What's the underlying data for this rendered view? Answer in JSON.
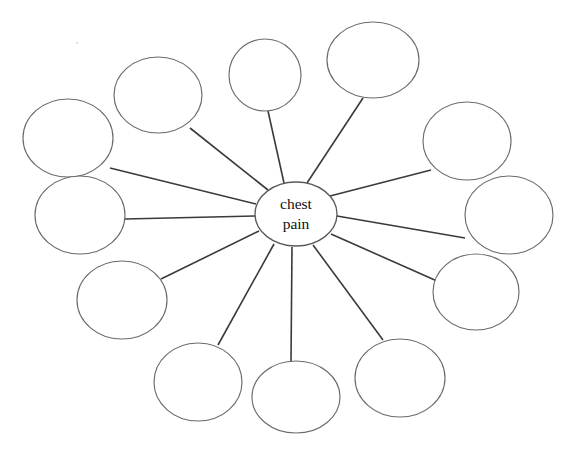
{
  "diagram": {
    "type": "spider-concept-map",
    "title_text": "chest pain",
    "center": {
      "label_line1": "chest",
      "label_line2": "pain",
      "cx": 296,
      "cy": 214,
      "rx": 41,
      "ry": 32
    },
    "stroke_color": "#6b6b6b",
    "spoke_color": "#3a3a3a",
    "background_color": "#ffffff",
    "satellite_count": 12,
    "satellites": [
      {
        "id": "node-1",
        "label": "",
        "position": "upper-left-outer",
        "cx": 68,
        "cy": 138,
        "rx": 45,
        "ry": 39
      },
      {
        "id": "node-2",
        "label": "",
        "position": "upper-left",
        "cx": 158,
        "cy": 95,
        "rx": 44,
        "ry": 38
      },
      {
        "id": "node-3",
        "label": "",
        "position": "top-center",
        "cx": 265,
        "cy": 75,
        "rx": 36,
        "ry": 36
      },
      {
        "id": "node-4",
        "label": "",
        "position": "top-right",
        "cx": 373,
        "cy": 60,
        "rx": 46,
        "ry": 38
      },
      {
        "id": "node-5",
        "label": "",
        "position": "right-upper",
        "cx": 467,
        "cy": 141,
        "rx": 44,
        "ry": 39
      },
      {
        "id": "node-6",
        "label": "",
        "position": "right-middle",
        "cx": 509,
        "cy": 215,
        "rx": 44,
        "ry": 39
      },
      {
        "id": "node-7",
        "label": "",
        "position": "right-lower",
        "cx": 476,
        "cy": 292,
        "rx": 43,
        "ry": 38
      },
      {
        "id": "node-8",
        "label": "",
        "position": "bottom-right",
        "cx": 400,
        "cy": 378,
        "rx": 45,
        "ry": 39
      },
      {
        "id": "node-9",
        "label": "",
        "position": "bottom-center",
        "cx": 296,
        "cy": 397,
        "rx": 44,
        "ry": 36
      },
      {
        "id": "node-10",
        "label": "",
        "position": "bottom-left",
        "cx": 198,
        "cy": 382,
        "rx": 44,
        "ry": 39
      },
      {
        "id": "node-11",
        "label": "",
        "position": "lower-left",
        "cx": 122,
        "cy": 300,
        "rx": 45,
        "ry": 39
      },
      {
        "id": "node-12",
        "label": "",
        "position": "left-middle",
        "cx": 80,
        "cy": 215,
        "rx": 45,
        "ry": 39
      }
    ],
    "spokes": [
      {
        "id": "spoke-1",
        "from": "center",
        "to": "node-1",
        "x1": 256,
        "y1": 204,
        "x2": 110,
        "y2": 168
      },
      {
        "id": "spoke-2",
        "from": "center",
        "to": "node-2",
        "x1": 268,
        "y1": 190,
        "x2": 190,
        "y2": 128
      },
      {
        "id": "spoke-3",
        "from": "center",
        "to": "node-3",
        "x1": 284,
        "y1": 183,
        "x2": 268,
        "y2": 111
      },
      {
        "id": "spoke-4",
        "from": "center",
        "to": "node-4",
        "x1": 307,
        "y1": 183,
        "x2": 363,
        "y2": 98
      },
      {
        "id": "spoke-5",
        "from": "center",
        "to": "node-5",
        "x1": 330,
        "y1": 196,
        "x2": 431,
        "y2": 170
      },
      {
        "id": "spoke-6",
        "from": "center",
        "to": "node-6",
        "x1": 337,
        "y1": 216,
        "x2": 465,
        "y2": 238
      },
      {
        "id": "spoke-7",
        "from": "center",
        "to": "node-7",
        "x1": 331,
        "y1": 234,
        "x2": 437,
        "y2": 281
      },
      {
        "id": "spoke-8",
        "from": "center",
        "to": "node-8",
        "x1": 313,
        "y1": 245,
        "x2": 383,
        "y2": 340
      },
      {
        "id": "spoke-9",
        "from": "center",
        "to": "node-9",
        "x1": 292,
        "y1": 247,
        "x2": 291,
        "y2": 361
      },
      {
        "id": "spoke-10",
        "from": "center",
        "to": "node-10",
        "x1": 274,
        "y1": 244,
        "x2": 218,
        "y2": 345
      },
      {
        "id": "spoke-11",
        "from": "center",
        "to": "node-11",
        "x1": 259,
        "y1": 231,
        "x2": 161,
        "y2": 279
      },
      {
        "id": "spoke-12",
        "from": "center",
        "to": "node-12",
        "x1": 255,
        "y1": 216,
        "x2": 125,
        "y2": 219
      }
    ]
  }
}
